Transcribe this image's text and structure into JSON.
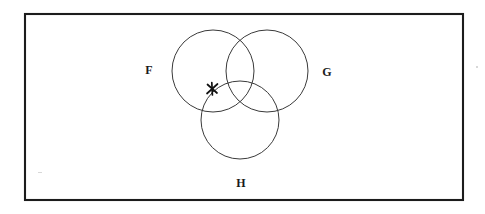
{
  "figure": {
    "type": "venn-diagram",
    "universe": {
      "shape": "rectangle",
      "x": 25,
      "y": 14,
      "width": 438,
      "height": 186,
      "stroke_color": "#1c1c1c"
    },
    "circles": [
      {
        "id": "F",
        "cx": 213,
        "cy": 71,
        "r": 41,
        "stroke_color": "#3a3a3a"
      },
      {
        "id": "G",
        "cx": 267,
        "cy": 71,
        "r": 41,
        "stroke_color": "#3a3a3a"
      },
      {
        "id": "H",
        "cx": 240,
        "cy": 120,
        "r": 39,
        "stroke_color": "#3a3a3a"
      }
    ],
    "labels": [
      {
        "id": "label-f",
        "text": "F",
        "x": 149,
        "y": 71
      },
      {
        "id": "label-g",
        "text": "G",
        "x": 327,
        "y": 73
      },
      {
        "id": "label-h",
        "text": "H",
        "x": 241,
        "y": 184
      }
    ],
    "point_mark": {
      "id": "x-mark",
      "symbol": "X",
      "x": 212,
      "y": 89,
      "size": 7,
      "color": "#111111",
      "region": "inside F only, near boundary of H"
    }
  }
}
